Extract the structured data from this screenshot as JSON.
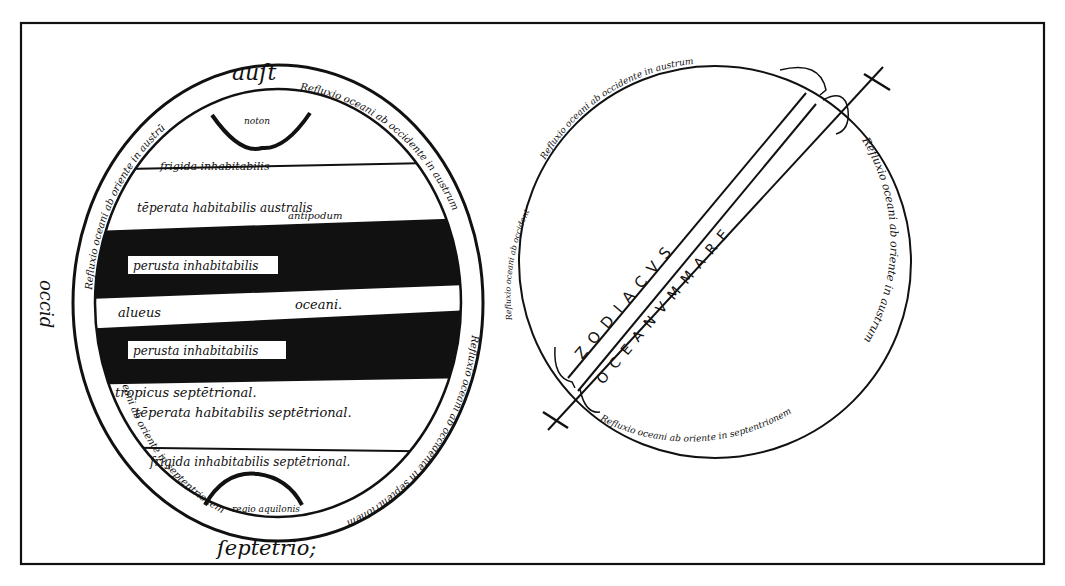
{
  "figure": {
    "colors": {
      "ink": "#111111",
      "paper": "#ffffff"
    }
  },
  "left_diagram": {
    "top_label": "auſt",
    "bottom_label": "ſeptētrio;",
    "side_label": "occid",
    "zones": [
      {
        "name": "frigida-south",
        "label": "frigida inhabitabilis",
        "fill": "white"
      },
      {
        "name": "temperate-south",
        "label": "tēperata habitabilis australis",
        "sub_label": "antipodum",
        "fill": "white"
      },
      {
        "name": "torrid-south",
        "label": "perusta inhabitabilis",
        "fill": "black"
      },
      {
        "name": "ocean-channel",
        "label_left": "alueus",
        "label_right": "oceani.",
        "fill": "white"
      },
      {
        "name": "torrid-north",
        "label": "perusta inhabitabilis",
        "fill": "black"
      },
      {
        "name": "temperate-north",
        "label": "tropicus septētrional.",
        "sub_label": "tēperata habitabilis septētrional.",
        "fill": "white"
      },
      {
        "name": "frigida-north",
        "label": "frigida inhabitabilis septētrional.",
        "fill": "white"
      }
    ],
    "polar_caps": {
      "top": "noton",
      "bottom": "regio aquilonis"
    },
    "ring_texts": {
      "upper_left": "Refluxio oceani ab oriente in austrū",
      "upper_right": "Refluxio oceani ab occidente in austrum",
      "lower_left": "Refluxio oceani ab oriente in septentrionem",
      "lower_right": "Refluxio oceani ab occidente in septentrionem"
    }
  },
  "right_diagram": {
    "band_upper_text": "Z O D I A C V S",
    "band_lower_text": "O C E A N V M  M A R E",
    "ring_texts": {
      "top": "Refluxio oceani ab occidente in austrum",
      "right": "Refluxio oceani ab oriente in austrum",
      "bottom": "Refluxio oceani ab oriente in septentrionem",
      "left": "Refluxio oceani ab occidente in septentrionem"
    },
    "right_label": "Refluxio"
  }
}
